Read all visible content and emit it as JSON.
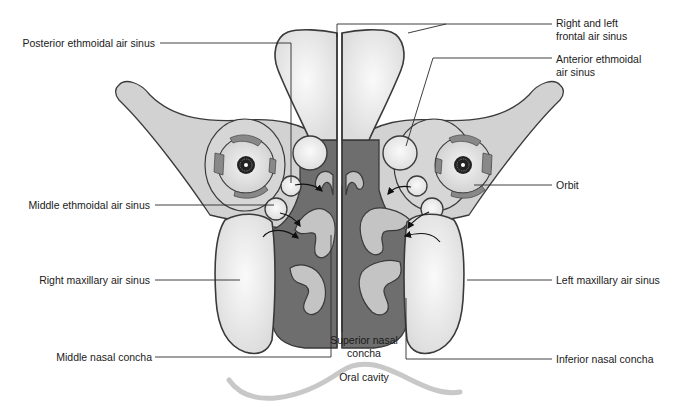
{
  "diagram": {
    "colors": {
      "bone_fill": "#d2d2d2",
      "sinus_fill": "#ececec",
      "nasal_cavity_fill": "#6e6e6e",
      "concha_fill": "#c4c4c4",
      "outline": "#3a3a3a",
      "oral_curve": "#c8c8c8",
      "leader_line": "#2a2a2a"
    },
    "labels": {
      "posterior_ethmoidal": "Posterior ethmoidal air sinus",
      "middle_ethmoidal": "Middle ethmoidal air sinus",
      "right_maxillary": "Right maxillary air sinus",
      "middle_nasal_concha": "Middle nasal concha",
      "frontal_line1": "Right and left",
      "frontal_line2": "frontal air sinus",
      "anterior_ethmoidal_line1": "Anterior ethmoidal",
      "anterior_ethmoidal_line2": "air sinus",
      "orbit": "Orbit",
      "left_maxillary": "Left maxillary air sinus",
      "inferior_nasal_concha": "Inferior nasal concha",
      "superior_nasal_line1": "Superior nasal",
      "superior_nasal_line2": "concha",
      "oral_cavity": "Oral cavity"
    },
    "icons": [
      "eyeball-icon-right",
      "eyeball-icon-left",
      "airflow-arrow-icon"
    ]
  }
}
